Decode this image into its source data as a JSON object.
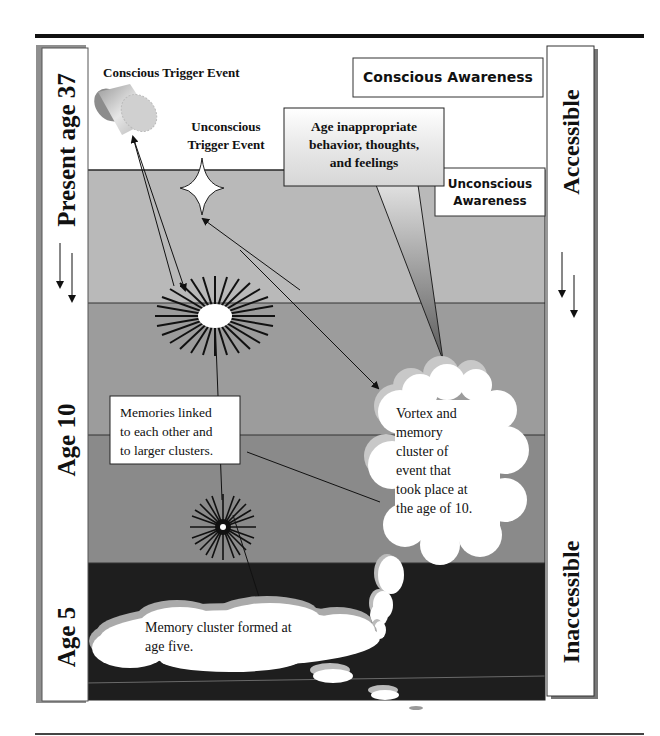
{
  "diagram": {
    "left_axis_labels": {
      "top": "Present age 37",
      "middle": "Age 10",
      "bottom": "Age 5"
    },
    "right_axis_labels": {
      "top": "Accessible",
      "bottom": "Inaccessible"
    },
    "labels": {
      "conscious_trigger": "Conscious Trigger Event",
      "unconscious_trigger_line1": "Unconscious",
      "unconscious_trigger_line2": "Trigger Event",
      "conscious_awareness": "Conscious Awareness",
      "unconscious_awareness_line1": "Unconscious",
      "unconscious_awareness_line2": "Awareness"
    },
    "callouts": {
      "age_inappropriate": [
        "Age inappropriate",
        "behavior, thoughts,",
        "and feelings"
      ],
      "memories_linked": [
        "Memories linked",
        "to each other and",
        "to larger clusters."
      ],
      "vortex": [
        "Vortex and",
        "memory",
        "cluster of",
        "event that",
        "took place at",
        "the age of 10."
      ],
      "age_five": [
        "Memory cluster formed at",
        "age five."
      ]
    },
    "colors": {
      "band_top_white": "#ffffff",
      "band_1": "#b9b9b9",
      "band_2": "#9c9c9c",
      "band_3": "#8a8a8a",
      "band_4": "#1e1e1e",
      "line": "#111111"
    }
  }
}
